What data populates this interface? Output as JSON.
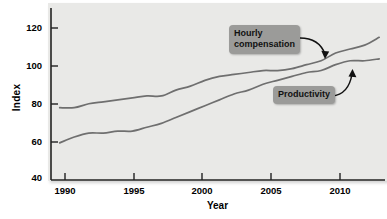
{
  "chart_data": {
    "type": "line",
    "title": "",
    "xlabel": "Year",
    "ylabel": "Index",
    "xlim": [
      1989.4,
      2012.4
    ],
    "ylim": [
      40,
      128
    ],
    "xticks": [
      1990,
      1995,
      2000,
      2005,
      2010
    ],
    "yticks": [
      40,
      60,
      80,
      100,
      120
    ],
    "grid": false,
    "legend": "annotated-callouts",
    "annotations": [
      {
        "text": "Hourly\ncompensation",
        "points_to_series": "Hourly compensation"
      },
      {
        "text": "Productivity",
        "points_to_series": "Productivity"
      }
    ],
    "x": [
      1990,
      1991,
      1992,
      1993,
      1994,
      1995,
      1996,
      1997,
      1998,
      1999,
      2000,
      2001,
      2002,
      2003,
      2004,
      2005,
      2006,
      2007,
      2008,
      2009,
      2010,
      2011,
      2012
    ],
    "series": [
      {
        "name": "Hourly compensation",
        "color": "#6f6f6f",
        "values": [
          77,
          77,
          79,
          80,
          81,
          82,
          83,
          83,
          86,
          88,
          91,
          93,
          94,
          95,
          96,
          96,
          97,
          99,
          101,
          105,
          107,
          109,
          113
        ]
      },
      {
        "name": "Productivity",
        "color": "#6f6f6f",
        "values": [
          59,
          62,
          64,
          64,
          65,
          65,
          67,
          69,
          72,
          75,
          78,
          81,
          84,
          86,
          89,
          91,
          93,
          95,
          96,
          99,
          101,
          101,
          102
        ]
      }
    ]
  },
  "axes": {
    "ylabel": "Index",
    "xlabel": "Year",
    "ytick_labels": [
      "120",
      "100",
      "80",
      "60",
      "40"
    ],
    "xtick_labels": [
      "1990",
      "1995",
      "2000",
      "2005",
      "2010"
    ]
  },
  "callouts": {
    "hourly_compensation": "Hourly\ncompensation",
    "productivity": "Productivity"
  },
  "colors": {
    "panel": "#e9e9e7",
    "line": "#6f6f6f",
    "axis": "#222222",
    "callout_box": "#9b9b99",
    "text": "#000000"
  }
}
